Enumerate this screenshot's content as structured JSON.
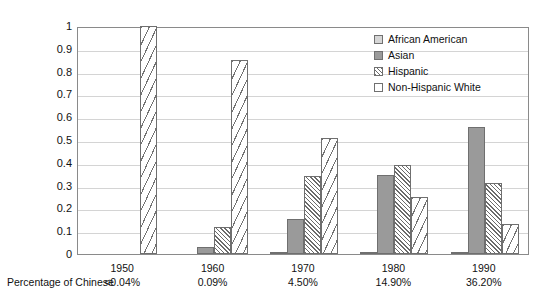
{
  "chart_data": {
    "type": "bar",
    "title": "",
    "xlabel": "",
    "ylabel": "",
    "ylim": [
      0,
      1
    ],
    "grid": true,
    "legend_position": "top-right",
    "categories": [
      "1950",
      "1960",
      "1970",
      "1980",
      "1990"
    ],
    "yticks": [
      "1",
      "0.9",
      "0.8",
      "0.7",
      "0.6",
      "0.5",
      "0.4",
      "0.3",
      "0.2",
      "0.1",
      "0"
    ],
    "series": [
      {
        "name": "African American",
        "values": [
          0,
          0,
          0.01,
          0.01,
          0.008
        ]
      },
      {
        "name": "Asian",
        "values": [
          0,
          0.03,
          0.155,
          0.345,
          0.555
        ]
      },
      {
        "name": "Hispanic",
        "values": [
          0,
          0.12,
          0.34,
          0.39,
          0.31
        ]
      },
      {
        "name": "Non-Hispanic White",
        "values": [
          1.0,
          0.85,
          0.51,
          0.25,
          0.13
        ]
      }
    ],
    "row_label": "Percentage of Chinese",
    "percentages": [
      "<0.04%",
      "0.09%",
      "4.50%",
      "14.90%",
      "36.20%"
    ]
  },
  "legend": {
    "items": [
      {
        "label": "African American"
      },
      {
        "label": "Asian"
      },
      {
        "label": "Hispanic"
      },
      {
        "label": "Non-Hispanic White"
      }
    ]
  },
  "colors": {
    "african_american": "#d6d6d6",
    "asian": "#9a9a9a",
    "hispanic": "#6b6b6b",
    "non_hispanic_white": "#ffffff",
    "axis": "#8a8a8a",
    "grid": "#d4d4d4",
    "text": "#111111"
  }
}
